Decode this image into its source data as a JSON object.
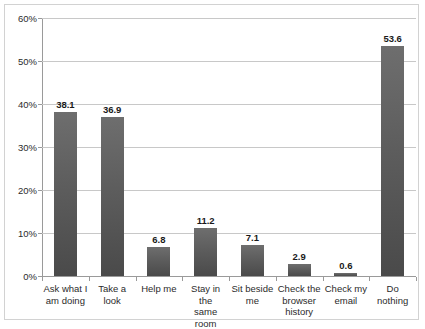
{
  "chart_data": {
    "type": "bar",
    "title": "",
    "subtitle": "",
    "xlabel": "",
    "ylabel": "",
    "categories": [
      "Ask what I am doing",
      "Take a look",
      "Help me",
      "Stay in the same room",
      "Sit beside me",
      "Check the browser history",
      "Check my email",
      "Do nothing"
    ],
    "category_lines": [
      [
        "Ask what I",
        "am doing"
      ],
      [
        "Take a look"
      ],
      [
        "Help me"
      ],
      [
        "Stay in the",
        "same room"
      ],
      [
        "Sit beside",
        "me"
      ],
      [
        "Check the",
        "browser",
        "history"
      ],
      [
        "Check my",
        "email"
      ],
      [
        "Do nothing"
      ]
    ],
    "values": [
      38.1,
      36.9,
      6.8,
      11.2,
      7.1,
      2.9,
      0.6,
      53.6
    ],
    "value_labels": [
      "38.1",
      "36.9",
      "6.8",
      "11.2",
      "7.1",
      "2.9",
      "0.6",
      "53.6"
    ],
    "ylim": [
      0,
      60
    ],
    "ytick_values": [
      0,
      10,
      20,
      30,
      40,
      50,
      60
    ],
    "ytick_labels": [
      "0%",
      "10%",
      "20%",
      "30%",
      "40%",
      "50%",
      "60%"
    ],
    "grid": true,
    "legend": false,
    "legend_position": "none",
    "bar_color": "#5d5d5d",
    "gridline_color": "#c8c8c8",
    "axis_color": "#9a9a9a",
    "border_color": "#d2d2d2",
    "background_color": "#ffffff",
    "text_color": "#2b2b2b"
  }
}
